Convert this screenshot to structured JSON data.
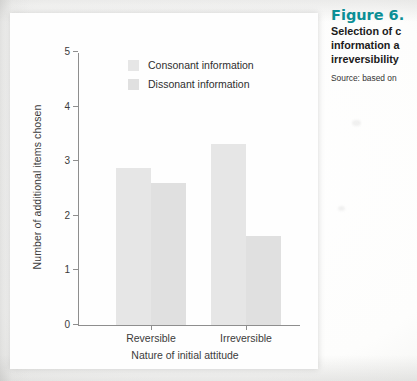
{
  "chart_data": {
    "type": "bar",
    "title": "",
    "xlabel": "Nature of initial attitude",
    "ylabel": "Number of additional items chosen",
    "categories": [
      "Reversible",
      "Irreversible"
    ],
    "series": [
      {
        "name": "Consonant information",
        "values": [
          2.85,
          3.3
        ],
        "color": "#e6e6e6"
      },
      {
        "name": "Dissonant information",
        "values": [
          2.58,
          1.62
        ],
        "color": "#e0e0e0"
      }
    ],
    "ylim": [
      0,
      5
    ],
    "yticks": [
      "0",
      "1",
      "2",
      "3",
      "4",
      "5"
    ],
    "grid": false,
    "legend_position": "top-center"
  },
  "caption": {
    "figure_number": "Figure 6.",
    "line1": "Selection of c",
    "line2": "information a",
    "line3": "irreversibility",
    "source": "Source: based on",
    "accent_color": "#0c8f96"
  }
}
